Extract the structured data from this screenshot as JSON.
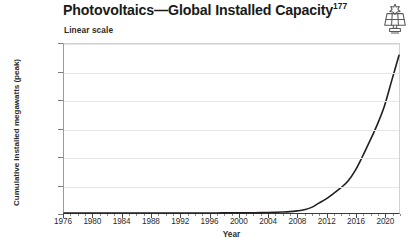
{
  "title": {
    "main": "Photovoltaics—Global Installed Capacity",
    "footnote": "177"
  },
  "subtitle": "Linear scale",
  "icon": {
    "name": "solar-panel-icon",
    "color": "#58595b"
  },
  "chart_data": {
    "type": "line",
    "title": "Photovoltaics—Global Installed Capacity",
    "subtitle": "Linear scale",
    "xlabel": "Year",
    "ylabel": "Cumulative installed megawatts (peak)",
    "xlim": [
      1976,
      2022
    ],
    "ylim": [
      0,
      1200000
    ],
    "grid": true,
    "legend": false,
    "y_tick_labels": [
      "0",
      "200,000",
      "400,000",
      "600,000",
      "800,000",
      "1,000,000",
      "1,200,000"
    ],
    "y_tick_values": [
      0,
      200000,
      400000,
      600000,
      800000,
      1000000,
      1200000
    ],
    "x_tick_labels": [
      "1976",
      "1980",
      "1984",
      "1988",
      "1992",
      "1996",
      "2000",
      "2004",
      "2008",
      "2012",
      "2016",
      "2020"
    ],
    "x_tick_values": [
      1976,
      1980,
      1984,
      1988,
      1992,
      1996,
      2000,
      2004,
      2008,
      2012,
      2016,
      2020
    ],
    "x_minor_step": 1,
    "line_color": "#231f20",
    "line_width": 1.6,
    "series": [
      {
        "name": "Cumulative installed capacity",
        "x": [
          1976,
          1977,
          1978,
          1979,
          1980,
          1981,
          1982,
          1983,
          1984,
          1985,
          1986,
          1987,
          1988,
          1989,
          1990,
          1991,
          1992,
          1993,
          1994,
          1995,
          1996,
          1997,
          1998,
          1999,
          2000,
          2001,
          2002,
          2003,
          2004,
          2005,
          2006,
          2007,
          2008,
          2009,
          2010,
          2011,
          2012,
          2013,
          2014,
          2015,
          2016,
          2017,
          2018,
          2019,
          2020,
          2021,
          2022
        ],
        "values": [
          2,
          3,
          4,
          6,
          8,
          11,
          15,
          20,
          27,
          35,
          45,
          57,
          72,
          90,
          110,
          135,
          165,
          200,
          245,
          300,
          370,
          460,
          580,
          750,
          1000,
          1400,
          2000,
          2800,
          3900,
          5400,
          7000,
          9500,
          15000,
          23000,
          40000,
          70000,
          100000,
          138000,
          178000,
          228000,
          303000,
          403000,
          512000,
          626000,
          760000,
          940000,
          1120000
        ]
      }
    ],
    "annotations": []
  },
  "axes": {
    "x_title": "Year",
    "y_title": "Cumulative installed megawatts (peak)"
  }
}
